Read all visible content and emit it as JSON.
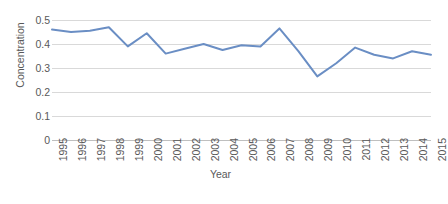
{
  "chart_data": {
    "type": "line",
    "title": "",
    "xlabel": "Year",
    "ylabel": "Concentration",
    "x": [
      1995,
      1996,
      1997,
      1998,
      1999,
      2000,
      2001,
      2002,
      2003,
      2004,
      2005,
      2006,
      2007,
      2008,
      2009,
      2010,
      2011,
      2012,
      2013,
      2014,
      2015
    ],
    "categories": [
      "1995",
      "1996",
      "1997",
      "1998",
      "1999",
      "2000",
      "2001",
      "2002",
      "2003",
      "2004",
      "2005",
      "2006",
      "2007",
      "2008",
      "2009",
      "2010",
      "2011",
      "2012",
      "2013",
      "2014",
      "2015"
    ],
    "series": [
      {
        "name": "Concentration",
        "color": "#6a8ec4",
        "values": [
          0.46,
          0.45,
          0.455,
          0.47,
          0.39,
          0.445,
          0.36,
          0.38,
          0.4,
          0.375,
          0.395,
          0.39,
          0.465,
          0.37,
          0.265,
          0.32,
          0.385,
          0.355,
          0.34,
          0.37,
          0.355
        ]
      }
    ],
    "ylim": [
      0,
      0.5
    ],
    "yticks": [
      "0.5",
      "0.4",
      "0.3",
      "0.2",
      "0.1",
      "0"
    ],
    "ytick_values": [
      0.5,
      0.4,
      0.3,
      0.2,
      0.1,
      0
    ],
    "grid": "horizontal",
    "legend": "none",
    "markers": "none",
    "line_width": 2
  }
}
